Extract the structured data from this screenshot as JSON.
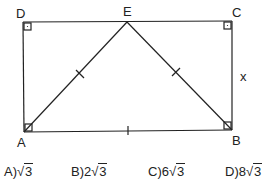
{
  "diagram": {
    "points": {
      "D": {
        "label": "D",
        "x": 23,
        "y": 22
      },
      "C": {
        "label": "C",
        "x": 232,
        "y": 21
      },
      "A": {
        "label": "A",
        "x": 24,
        "y": 132
      },
      "B": {
        "label": "B",
        "x": 232,
        "y": 130
      },
      "E": {
        "label": "E",
        "x": 127,
        "y": 22
      }
    },
    "side_label_x": "x",
    "segments": [
      "AB",
      "BC",
      "CD",
      "DA",
      "AE",
      "BE"
    ],
    "equal_marks": [
      "AE",
      "BE",
      "AB"
    ],
    "right_angles": [
      "D",
      "C",
      "A",
      "B"
    ],
    "stroke_color": "#222222"
  },
  "choices": [
    {
      "letter": "A)",
      "coef": "",
      "radicand": "3"
    },
    {
      "letter": "B)",
      "coef": "2",
      "radicand": "3"
    },
    {
      "letter": "C)",
      "coef": "6",
      "radicand": "3"
    },
    {
      "letter": "D)",
      "coef": "8",
      "radicand": "3"
    }
  ]
}
